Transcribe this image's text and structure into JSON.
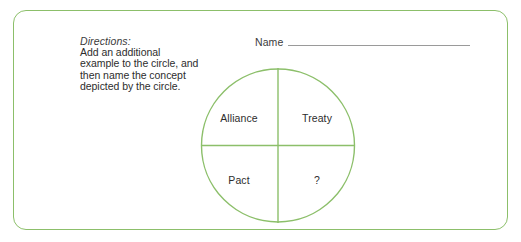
{
  "worksheet": {
    "directions": {
      "heading": "Directions:",
      "body": "Add an additional example to the circle, and then name the concept depicted by the circle."
    },
    "name_field": {
      "label": "Name",
      "value": ""
    },
    "diagram": {
      "type": "quartered-circle",
      "quadrants": [
        {
          "position": "top-left",
          "label": "Alliance"
        },
        {
          "position": "top-right",
          "label": "Treaty"
        },
        {
          "position": "bottom-left",
          "label": "Pact"
        },
        {
          "position": "bottom-right",
          "label": "?"
        }
      ]
    },
    "colors": {
      "border_green": "#8cbf6a",
      "circle_green": "#8cbf6a",
      "text_dark": "#2d2d2d",
      "name_line_gray": "#9a9a9a",
      "background": "#ffffff"
    }
  }
}
